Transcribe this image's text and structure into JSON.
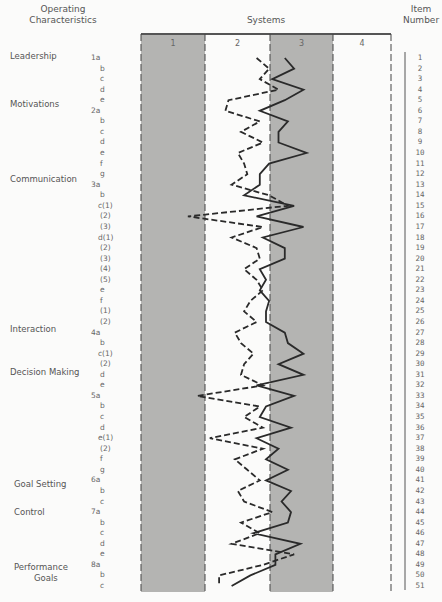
{
  "headers": {
    "operating_characteristics": "Operating Characteristics",
    "systems": "Systems",
    "item_number": "Item Number"
  },
  "columns": [
    "1",
    "2",
    "3",
    "4"
  ],
  "categories": [
    {
      "label": "Leadership",
      "y": 57,
      "x": 10
    },
    {
      "label": "Motivations",
      "y": 105,
      "x": 10
    },
    {
      "label": "Communication",
      "y": 180,
      "x": 10
    },
    {
      "label": "Interaction",
      "y": 330,
      "x": 10
    },
    {
      "label": "Decision Making",
      "y": 373,
      "x": 10
    },
    {
      "label": "Goal Setting",
      "y": 485,
      "x": 14
    },
    {
      "label": "Control",
      "y": 513,
      "x": 14
    },
    {
      "label": "Performance",
      "y": 568,
      "x": 14
    },
    {
      "label": "Goals",
      "y": 579,
      "x": 34
    }
  ],
  "sub_items": [
    "1a",
    "b",
    "c",
    "d",
    "e",
    "2a",
    "b",
    "c",
    "d",
    "e",
    "f",
    "g",
    "3a",
    "b",
    "c(1)",
    "(2)",
    "(3)",
    "d(1)",
    "(2)",
    "(3)",
    "(4)",
    "(5)",
    "e",
    "f",
    "(1)",
    "(2)",
    "4a",
    "b",
    "c(1)",
    "(2)",
    "d",
    "e",
    "5a",
    "b",
    "c",
    "d",
    "e(1)",
    "(2)",
    "f",
    "g",
    "6a",
    "b",
    "c",
    "7a",
    "b",
    "c",
    "d",
    "e",
    "8a",
    "b",
    "c"
  ],
  "item_numbers": [
    "1",
    "2",
    "3",
    "4",
    "5",
    "6",
    "7",
    "8",
    "9",
    "10",
    "11",
    "12",
    "13",
    "14",
    "15",
    "16",
    "17",
    "18",
    "19",
    "20",
    "21",
    "22",
    "23",
    "24",
    "25",
    "26",
    "27",
    "28",
    "29",
    "30",
    "31",
    "32",
    "33",
    "34",
    "35",
    "36",
    "37",
    "38",
    "39",
    "40",
    "41",
    "42",
    "43",
    "44",
    "45",
    "46",
    "47",
    "48",
    "49",
    "50",
    "51"
  ],
  "colors": {
    "shaded": "#b4b4b2",
    "line": "#2a2a2a",
    "text": "#555555"
  },
  "chart_data": {
    "type": "line",
    "xlabel": "Systems",
    "ylabel": "Item Number",
    "x_ticks": [
      "1",
      "2",
      "3",
      "4"
    ],
    "xlim": [
      1,
      5
    ],
    "orientation": "vertical-profile",
    "y": [
      1,
      2,
      3,
      4,
      5,
      6,
      7,
      8,
      9,
      10,
      11,
      12,
      13,
      14,
      15,
      16,
      17,
      18,
      19,
      20,
      21,
      22,
      23,
      24,
      25,
      26,
      27,
      28,
      29,
      30,
      31,
      32,
      33,
      34,
      35,
      36,
      37,
      38,
      39,
      40,
      41,
      42,
      43,
      44,
      45,
      46,
      47,
      48,
      49,
      50,
      51
    ],
    "series": [
      {
        "name": "solid",
        "style": "solid",
        "values": [
          3.3,
          3.45,
          3.1,
          3.6,
          3.3,
          2.9,
          3.35,
          3.2,
          3.2,
          3.65,
          3.05,
          2.9,
          2.9,
          2.65,
          3.45,
          2.85,
          3.6,
          2.95,
          3.3,
          3.3,
          2.9,
          3.0,
          2.9,
          3.05,
          3.0,
          3.0,
          3.3,
          3.35,
          3.6,
          3.2,
          3.6,
          2.85,
          3.45,
          3.0,
          2.9,
          3.4,
          2.85,
          3.2,
          3.0,
          3.35,
          3.0,
          3.4,
          3.25,
          3.4,
          3.35,
          2.8,
          3.55,
          3.15,
          3.15,
          2.75,
          2.45
        ]
      },
      {
        "name": "dashed",
        "style": "dashed",
        "values": [
          2.85,
          3.05,
          2.9,
          3.2,
          2.4,
          2.35,
          2.9,
          2.6,
          2.95,
          2.55,
          2.65,
          2.7,
          2.45,
          3.05,
          3.35,
          1.75,
          2.95,
          2.45,
          2.85,
          2.9,
          2.65,
          2.85,
          2.95,
          2.75,
          2.65,
          2.85,
          2.5,
          2.6,
          2.8,
          2.65,
          2.6,
          2.95,
          1.9,
          2.9,
          2.65,
          2.95,
          2.1,
          2.95,
          2.5,
          2.7,
          2.9,
          2.55,
          2.65,
          3.1,
          2.6,
          2.9,
          2.45,
          3.45,
          2.95,
          2.25,
          2.25
        ]
      }
    ]
  }
}
